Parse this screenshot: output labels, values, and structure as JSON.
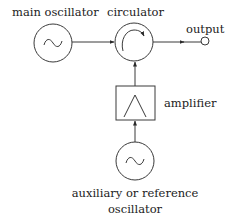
{
  "diagram": {
    "labels": {
      "main_oscillator": "main oscillator",
      "circulator": "circulator",
      "output": "output",
      "amplifier": "amplifier",
      "aux_line1": "auxiliary or reference",
      "aux_line2": "oscillator"
    },
    "symbols": {
      "sine": "~"
    },
    "components": [
      {
        "id": "main-oscillator",
        "type": "oscillator",
        "icon": "sine-wave-icon"
      },
      {
        "id": "circulator",
        "type": "circulator",
        "icon": "circular-arrow-icon"
      },
      {
        "id": "output-terminal",
        "type": "terminal"
      },
      {
        "id": "amplifier",
        "type": "amplifier",
        "icon": "triangle-icon"
      },
      {
        "id": "auxiliary-oscillator",
        "type": "oscillator",
        "icon": "sine-wave-icon"
      }
    ],
    "connections": [
      {
        "from": "main-oscillator",
        "to": "circulator"
      },
      {
        "from": "circulator",
        "to": "output-terminal"
      },
      {
        "from": "amplifier",
        "to": "circulator"
      },
      {
        "from": "auxiliary-oscillator",
        "to": "amplifier"
      }
    ],
    "colors": {
      "line": "#3a3a3a",
      "text": "#222222",
      "background": "#ffffff"
    }
  }
}
